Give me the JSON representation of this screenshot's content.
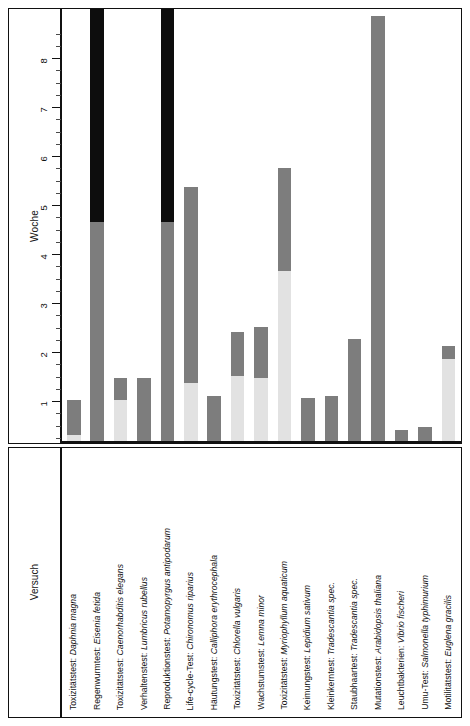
{
  "chart_data": {
    "type": "bar",
    "title": "",
    "subtitle": "",
    "xlabel": "Versuch",
    "ylabel": "Woche",
    "ylim": [
      0,
      8.85
    ],
    "grid": false,
    "legend": "none",
    "orientation": "vertical",
    "stacked": true,
    "axis_ticks": {
      "major": [
        1,
        2,
        3,
        4,
        5,
        6,
        7,
        8
      ],
      "minor_step": 0.25,
      "tick_labels": [
        "1",
        "2",
        "3",
        "4",
        "5",
        "6",
        "7",
        "8"
      ]
    },
    "series": [
      {
        "name": "segment-light",
        "color": "#e2e2e2",
        "values": [
          0.15,
          0,
          0.85,
          0,
          0,
          1.2,
          0,
          1.35,
          1.3,
          3.5,
          0,
          0,
          0,
          0,
          0,
          0,
          1.7
        ]
      },
      {
        "name": "segment-medium",
        "color": "#7d7d7d",
        "values": [
          0.7,
          4.5,
          0.45,
          1.3,
          4.5,
          4.0,
          0.95,
          0.9,
          1.05,
          2.1,
          0.9,
          0.95,
          2.1,
          8.7,
          0.25,
          0.3,
          0.25
        ]
      },
      {
        "name": "segment-dark",
        "color": "#0d0d0d",
        "values": [
          0,
          4.35,
          0,
          0,
          4.35,
          0,
          0,
          0,
          0,
          0,
          0,
          0,
          0,
          0,
          0,
          0,
          0
        ]
      }
    ],
    "totals": [
      0.85,
      8.85,
      1.3,
      1.3,
      8.85,
      5.2,
      0.95,
      2.25,
      2.35,
      5.6,
      0.9,
      0.95,
      2.1,
      8.7,
      0.25,
      0.3,
      1.95
    ],
    "categories": [
      "Toxizitätstest: Daphnia magna",
      "Regenwurmtest: Eisenia fetida",
      "Toxizitätstest: Caenorhabditis elegans",
      "Verhaltenstest: Lumbricus rubellus",
      "Reproduktionstest: Potamopyrgus antipodarum",
      "Life-cycle-Test: Chironomus riparius",
      "Häutungstest: Calliphora erythrocephala",
      "Toxizitätstest: Chlorella vulgaris",
      "Wachstumstest: Lemna minor",
      "Toxizitätstest: Myriophyllum aquaticum",
      "Keimungstest: Lepidium sativum",
      "Kleinkerntest: Tradescantia spec.",
      "Staubhaartest: Tradescantia spec.",
      "Mutationstest: Arabidopsis thaliana",
      "Leuchtbakterien: Vibrio fischeri",
      "Umu-Test: Salmonella typhimurium",
      "Motilitätstest: Euglena gracilis"
    ],
    "category_parts": [
      {
        "prefix": "Toxizitätstest: ",
        "species": "Daphnia magna"
      },
      {
        "prefix": "Regenwurmtest: ",
        "species": "Eisenia fetida"
      },
      {
        "prefix": "Toxizitätstest: ",
        "species": "Caenorhabditis elegans"
      },
      {
        "prefix": "Verhaltenstest: ",
        "species": "Lumbricus rubellus"
      },
      {
        "prefix": "Reproduktionstest: ",
        "species": "Potamopyrgus antipodarum"
      },
      {
        "prefix": "Life-cycle-Test: ",
        "species": "Chironomus riparius"
      },
      {
        "prefix": "Häutungstest: ",
        "species": "Calliphora erythrocephala"
      },
      {
        "prefix": "Toxizitätstest: ",
        "species": "Chlorella vulgaris"
      },
      {
        "prefix": "Wachstumstest: ",
        "species": "Lemna minor"
      },
      {
        "prefix": "Toxizitätstest: ",
        "species": "Myriophyllum aquaticum"
      },
      {
        "prefix": "Keimungstest: ",
        "species": "Lepidium sativum"
      },
      {
        "prefix": "Kleinkerntest: ",
        "species": "Tradescantia spec."
      },
      {
        "prefix": "Staubhaartest: ",
        "species": "Tradescantia spec."
      },
      {
        "prefix": "Mutationstest: ",
        "species": "Arabidopsis thaliana"
      },
      {
        "prefix": "Leuchtbakterien: ",
        "species": "Vibrio fischeri"
      },
      {
        "prefix": "Umu-Test: ",
        "species": "Salmonella typhimurium"
      },
      {
        "prefix": "Motilitätstest: ",
        "species": "Euglena gracilis"
      }
    ]
  },
  "axes": {
    "y_title": "Woche",
    "x_title": "Versuch"
  },
  "colors": {
    "segment_light": "#e2e2e2",
    "segment_medium": "#7d7d7d",
    "segment_dark": "#0d0d0d",
    "axis": "#111111",
    "background": "#ffffff"
  }
}
